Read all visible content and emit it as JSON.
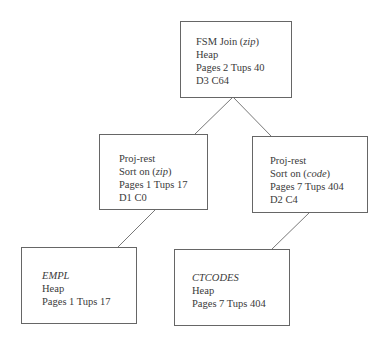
{
  "diagram": {
    "type": "query-plan-tree",
    "nodes": [
      {
        "id": "join",
        "lines": [
          {
            "pre": "FSM Join (",
            "it": "zip",
            "post": ")"
          },
          {
            "pre": "Heap",
            "it": "",
            "post": ""
          },
          {
            "pre": "Pages 2 Tups 40",
            "it": "",
            "post": ""
          },
          {
            "pre": "D3 C64",
            "it": "",
            "post": ""
          }
        ]
      },
      {
        "id": "proj-left",
        "lines": [
          {
            "pre": "Proj-rest",
            "it": "",
            "post": ""
          },
          {
            "pre": "Sort on (",
            "it": "zip",
            "post": ")"
          },
          {
            "pre": "Pages 1 Tups 17",
            "it": "",
            "post": ""
          },
          {
            "pre": "D1 C0",
            "it": "",
            "post": ""
          }
        ]
      },
      {
        "id": "proj-right",
        "lines": [
          {
            "pre": "Proj-rest",
            "it": "",
            "post": ""
          },
          {
            "pre": "Sort on (",
            "it": "code",
            "post": ")"
          },
          {
            "pre": "Pages 7 Tups 404",
            "it": "",
            "post": ""
          },
          {
            "pre": "D2 C4",
            "it": "",
            "post": ""
          }
        ]
      },
      {
        "id": "empl",
        "lines": [
          {
            "pre": "",
            "it": "EMPL",
            "post": ""
          },
          {
            "pre": "Heap",
            "it": "",
            "post": ""
          },
          {
            "pre": "Pages 1 Tups 17",
            "it": "",
            "post": ""
          }
        ]
      },
      {
        "id": "ctcodes",
        "lines": [
          {
            "pre": "",
            "it": "CTCODES",
            "post": ""
          },
          {
            "pre": "Heap",
            "it": "",
            "post": ""
          },
          {
            "pre": "Pages 7 Tups 404",
            "it": "",
            "post": ""
          }
        ]
      }
    ],
    "edges": [
      {
        "from": "join",
        "to": "proj-left"
      },
      {
        "from": "join",
        "to": "proj-right"
      },
      {
        "from": "proj-left",
        "to": "empl"
      },
      {
        "from": "proj-right",
        "to": "ctcodes"
      }
    ],
    "colors": {
      "border": "#666666",
      "edge": "#555555",
      "text": "#3a3a3a"
    }
  }
}
